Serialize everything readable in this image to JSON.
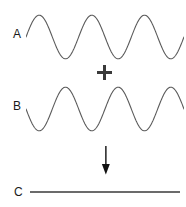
{
  "figure": {
    "background_color": "#ffffff",
    "width": 186,
    "height": 207
  },
  "labels": {
    "wave_a": "A",
    "wave_b": "B",
    "result_c": "C"
  },
  "operators": {
    "plus": "+",
    "arrow": "↓"
  },
  "colors": {
    "wave_stroke": "#5a5a5a",
    "operator": "#3a3a3a",
    "result_line": "#6b6b6b",
    "text": "#1a1a1a"
  },
  "chart_data": {
    "type": "line",
    "xlabel": "",
    "ylabel": "",
    "grid": false,
    "legend_position": "left",
    "axis_hidden": true,
    "x_range": [
      0,
      3
    ],
    "y_range": [
      -1,
      1
    ],
    "cycles": 3,
    "series": [
      {
        "name": "A",
        "label": "A",
        "waveform": "sine",
        "amplitude": 1,
        "phase_deg": 0,
        "cycles": 3,
        "description": "Sine wave starting at zero rising to a crest",
        "x": [
          0,
          0.25,
          0.5,
          0.75,
          1,
          1.25,
          1.5,
          1.75,
          2,
          2.25,
          2.5,
          2.75,
          3
        ],
        "values": [
          0,
          1,
          0,
          -1,
          0,
          1,
          0,
          -1,
          0,
          1,
          0,
          -1,
          0
        ]
      },
      {
        "name": "B",
        "label": "B",
        "waveform": "sine",
        "amplitude": 1,
        "phase_deg": 180,
        "cycles": 3,
        "description": "Sine wave inverted 180 degrees out of phase with A",
        "x": [
          0,
          0.25,
          0.5,
          0.75,
          1,
          1.25,
          1.5,
          1.75,
          2,
          2.25,
          2.5,
          2.75,
          3
        ],
        "values": [
          0,
          -1,
          0,
          1,
          0,
          -1,
          0,
          1,
          0,
          -1,
          0,
          1,
          0
        ]
      },
      {
        "name": "C",
        "label": "C",
        "waveform": "flat",
        "amplitude": 0,
        "phase_deg": 0,
        "cycles": 0,
        "description": "Sum of A and B: flat line, complete cancellation",
        "x": [
          0,
          0.25,
          0.5,
          0.75,
          1,
          1.25,
          1.5,
          1.75,
          2,
          2.25,
          2.5,
          2.75,
          3
        ],
        "values": [
          0,
          0,
          0,
          0,
          0,
          0,
          0,
          0,
          0,
          0,
          0,
          0,
          0
        ]
      }
    ],
    "annotations": [
      {
        "type": "operator",
        "text": "+",
        "between": [
          "A",
          "B"
        ]
      },
      {
        "type": "operator",
        "text": "↓",
        "between": [
          "B",
          "C"
        ]
      }
    ]
  }
}
